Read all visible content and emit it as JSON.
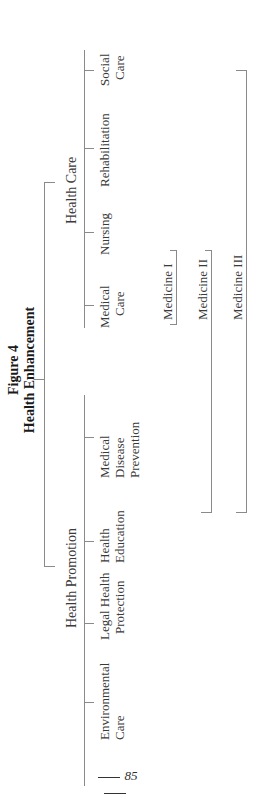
{
  "figure": {
    "label": "Figure 4",
    "title": "Health Enhancement"
  },
  "groups": [
    {
      "label": "Health Care",
      "children": [
        {
          "line1": "Medical",
          "line2": "Care"
        },
        {
          "line1": "Nursing",
          "line2": ""
        },
        {
          "line1": "Rehabilitation",
          "line2": ""
        },
        {
          "line1": "Social",
          "line2": "Care"
        }
      ]
    },
    {
      "label": "Health Promotion",
      "children": [
        {
          "line1": "Environmental",
          "line2": "Care"
        },
        {
          "line1": "Legal Health",
          "line2": "Protection"
        },
        {
          "line1": "Health",
          "line2": "Education"
        },
        {
          "line1": "Medical",
          "line2": "Disease",
          "line3": "Prevention"
        }
      ]
    }
  ],
  "medicine_brackets": [
    {
      "label": "Medicine I"
    },
    {
      "label": "Medicine II"
    },
    {
      "label": "Medicine III"
    }
  ],
  "page": {
    "number": "85"
  }
}
